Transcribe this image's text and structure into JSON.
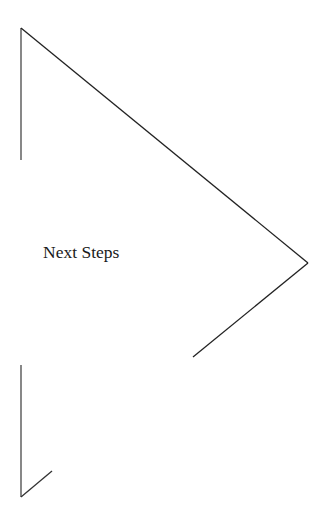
{
  "diagram": {
    "label": "Next Steps",
    "shape": "arrow-pentagon-outline",
    "colors": {
      "background": "#ffffff",
      "stroke_vertical": "#555555",
      "stroke_diagonal": "#222222",
      "text": "#1a1a1a"
    }
  }
}
